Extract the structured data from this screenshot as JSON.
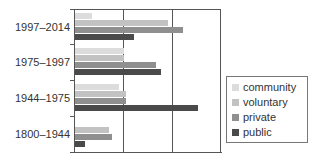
{
  "chart_data": {
    "type": "bar",
    "orientation": "horizontal",
    "title": "",
    "xlabel": "",
    "ylabel": "",
    "categories": [
      "1997–2014",
      "1975–1997",
      "1944–1975",
      "1800–1944"
    ],
    "x_ticks_labeled": false,
    "xlim": [
      0,
      3
    ],
    "grid": true,
    "legend_position": "right",
    "series": [
      {
        "name": "community",
        "color": "#dcdcdc",
        "values": [
          0.35,
          1.0,
          0.9,
          0.0
        ]
      },
      {
        "name": "voluntary",
        "color": "#c2c2c2",
        "values": [
          1.9,
          1.0,
          1.05,
          0.7
        ]
      },
      {
        "name": "private",
        "color": "#8f8f8f",
        "values": [
          2.2,
          1.65,
          1.05,
          0.75
        ]
      },
      {
        "name": "public",
        "color": "#4a4a4a",
        "values": [
          1.2,
          1.75,
          2.5,
          0.2
        ]
      }
    ]
  },
  "labels": {
    "cat0": "1997–2014",
    "cat1": "1975–1997",
    "cat2": "1944–1975",
    "cat3": "1800–1944"
  },
  "legend": {
    "items": [
      {
        "label": "community",
        "color": "#dcdcdc"
      },
      {
        "label": "voluntary",
        "color": "#c2c2c2"
      },
      {
        "label": "private",
        "color": "#8f8f8f"
      },
      {
        "label": "public",
        "color": "#4a4a4a"
      }
    ]
  }
}
